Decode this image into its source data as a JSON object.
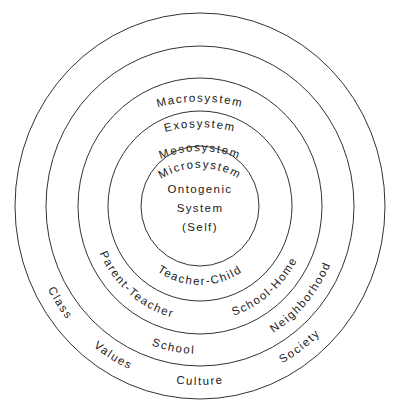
{
  "diagram": {
    "type": "concentric-circles",
    "center": {
      "lines": [
        "Ontogenic",
        "System",
        "(Self)"
      ]
    },
    "rings": {
      "microsystem": {
        "title": "Microsystem",
        "bottom_labels": [
          "Teacher-Child"
        ]
      },
      "mesosystem": {
        "title": "Mesosystem",
        "bottom_labels": [
          "Parent-Teacher",
          "School-Home"
        ]
      },
      "exosystem": {
        "title": "Exosystem",
        "bottom_labels": [
          "School",
          "Neighborhood"
        ]
      },
      "macrosystem": {
        "title": "Macrosystem",
        "bottom_labels": [
          "Class",
          "Values",
          "Culture",
          "Society"
        ]
      }
    },
    "colors": {
      "stroke": "#333333",
      "text": "#222222",
      "background": "#ffffff"
    }
  }
}
